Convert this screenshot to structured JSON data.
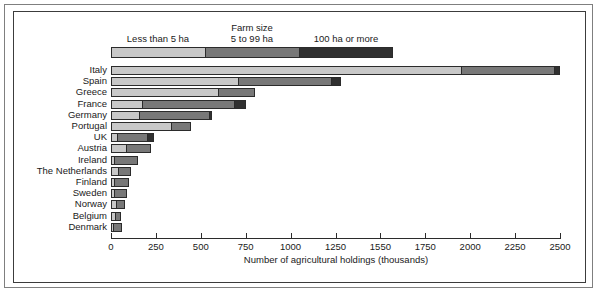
{
  "chart_data": {
    "type": "bar",
    "subtype": "stacked-horizontal-bar",
    "title": "",
    "xlabel": "Number of agricultural holdings (thousands)",
    "ylabel": "",
    "xlim": [
      0,
      2500
    ],
    "xticks": [
      0,
      250,
      500,
      750,
      1000,
      1250,
      1550,
      1750,
      2000,
      2250,
      2500
    ],
    "xticklabels": [
      "0",
      "250",
      "500",
      "750",
      "1000",
      "1250",
      "1550",
      "1750",
      "2000",
      "2250",
      "2500"
    ],
    "grid": false,
    "legend": {
      "title": "Farm size",
      "position": "top",
      "entries": [
        {
          "label": "Less than 5 ha",
          "color": "#c8c8c8"
        },
        {
          "label": "5 to 99 ha",
          "color": "#787878"
        },
        {
          "label": "100 ha or more",
          "color": "#303030"
        }
      ]
    },
    "categories": [
      "Italy",
      "Spain",
      "Greece",
      "France",
      "Germany",
      "Portugal",
      "UK",
      "Austria",
      "Ireland",
      "The Netherlands",
      "Finland",
      "Sweden",
      "Norway",
      "Belgium",
      "Denmark"
    ],
    "series": [
      {
        "name": "Less than 5 ha",
        "color": "#c8c8c8",
        "values": [
          1950,
          705,
          600,
          170,
          155,
          335,
          30,
          85,
          15,
          35,
          10,
          10,
          25,
          20,
          5
        ]
      },
      {
        "name": "5 to 99 ha",
        "color": "#787878",
        "values": [
          520,
          525,
          200,
          520,
          395,
          110,
          175,
          135,
          135,
          75,
          90,
          80,
          55,
          35,
          55
        ]
      },
      {
        "name": "100 ha or more",
        "color": "#303030",
        "values": [
          30,
          50,
          0,
          60,
          15,
          0,
          35,
          0,
          0,
          0,
          0,
          0,
          0,
          0,
          0
        ]
      }
    ],
    "totals": [
      2500,
      1280,
      800,
      750,
      565,
      445,
      240,
      220,
      150,
      110,
      100,
      90,
      80,
      55,
      60
    ]
  },
  "figure": {
    "axis_title": "Number of agricultural holdings (thousands)",
    "legend_title": "Farm size"
  }
}
